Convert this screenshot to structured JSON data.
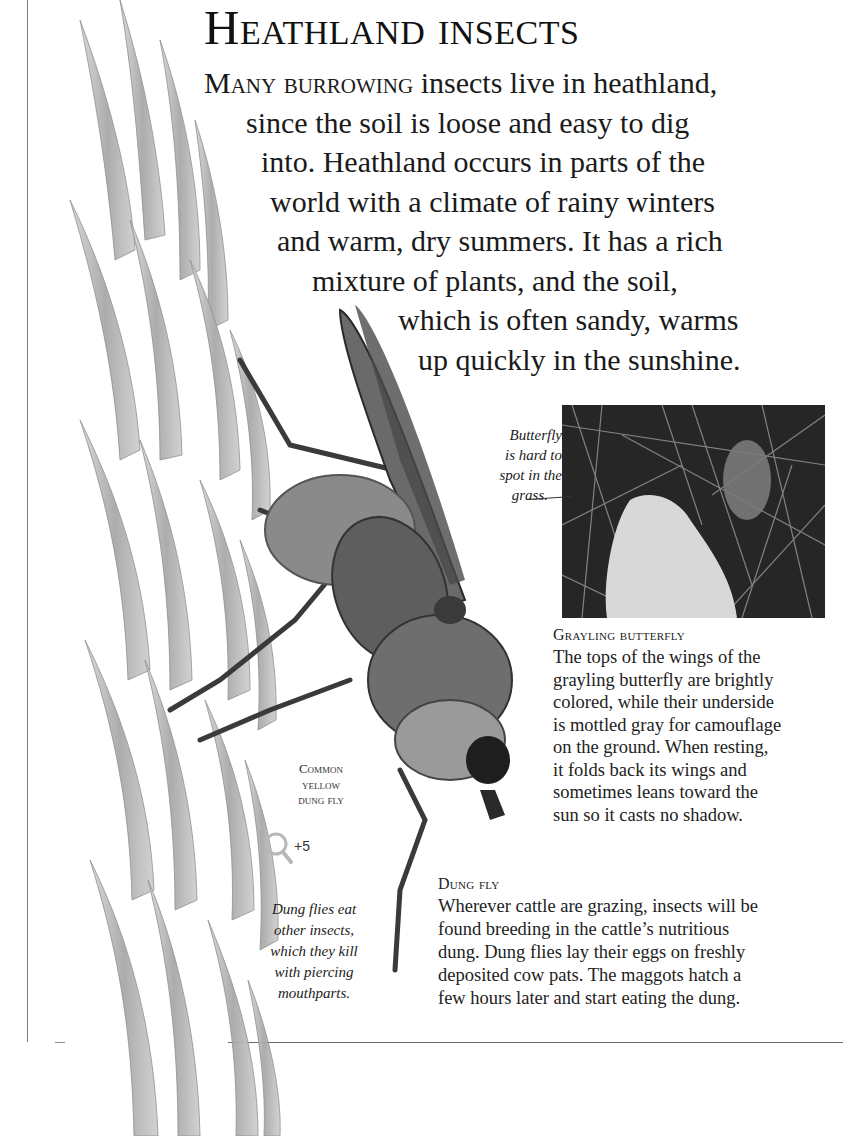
{
  "page": {
    "title": "Heathland insects",
    "intro": {
      "lead": "Many burrowing",
      "lines": [
        " insects live in heathland,",
        "since the soil is loose and easy to dig",
        "into. Heathland occurs in parts of the",
        "world with a climate of rainy winters",
        "and warm, dry summers. It has a rich",
        "mixture of plants, and the soil,",
        "which is often sandy, warms",
        "up quickly in the sunshine."
      ]
    }
  },
  "photo_butterfly": {
    "callout_lines": [
      "Butterfly",
      "is hard to",
      "spot in the",
      "grass."
    ]
  },
  "grayling": {
    "heading": "Grayling butterfly",
    "lines": [
      "The tops of the wings of the",
      "grayling butterfly are brightly",
      "colored, while their underside",
      "is mottled gray for camouflage",
      "on the ground. When resting,",
      "it folds back its wings and",
      "sometimes leans toward the",
      "sun so it casts no shadow."
    ]
  },
  "fly_label": {
    "lines": [
      "Common",
      "yellow",
      "dung fly"
    ],
    "magnification": "+5",
    "icon": "magnifier-icon"
  },
  "dung_note": {
    "lines": [
      "Dung flies eat",
      "other insects,",
      "which they kill",
      "with piercing",
      "mouthparts."
    ]
  },
  "dung_fly": {
    "heading": "Dung fly",
    "lines": [
      "Wherever cattle are grazing, insects will be",
      "found breeding in the cattle’s nutritious",
      "dung. Dung flies lay their eggs on freshly",
      "deposited cow pats. The maggots hatch a",
      "few hours later and start eating the dung."
    ]
  },
  "colors": {
    "text": "#1a1a1a",
    "rule": "#6a6a6a",
    "grass_light": "#c8c8c8",
    "grass_dark": "#8a8a8a",
    "fly_body": "#5a5a5a",
    "photo_dark": "#2a2a2a"
  }
}
